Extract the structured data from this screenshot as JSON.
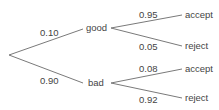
{
  "diagram": {
    "type": "probability-tree",
    "colors": {
      "line": "#7a7a7a",
      "text": "#444444",
      "background": "#ffffff"
    },
    "root": {
      "branches": [
        {
          "label": "good",
          "probability": "0.10",
          "branches": [
            {
              "label": "accept",
              "probability": "0.95"
            },
            {
              "label": "reject",
              "probability": "0.05"
            }
          ]
        },
        {
          "label": "bad",
          "probability": "0.90",
          "branches": [
            {
              "label": "accept",
              "probability": "0.08"
            },
            {
              "label": "reject",
              "probability": "0.92"
            }
          ]
        }
      ]
    }
  }
}
